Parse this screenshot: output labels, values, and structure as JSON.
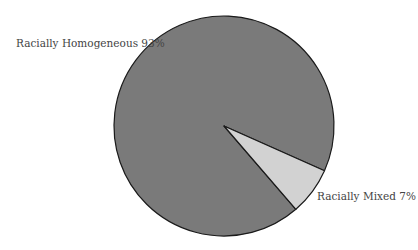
{
  "chart_data": {
    "type": "pie",
    "title": "",
    "categories": [
      "Racially Homogeneous",
      "Racially Mixed"
    ],
    "values": [
      93,
      7
    ],
    "unit": "%",
    "labels": [
      "Racially Homogeneous 93%",
      "Racially Mixed 7%"
    ],
    "colors": [
      "#7a7a7a",
      "#d2d2d2"
    ],
    "legend": "none (direct labels)",
    "start_angle_deg": 24,
    "direction": "clockwise"
  },
  "labels": {
    "homogeneous": "Racially Homogeneous 93%",
    "mixed": "Racially Mixed 7%"
  }
}
